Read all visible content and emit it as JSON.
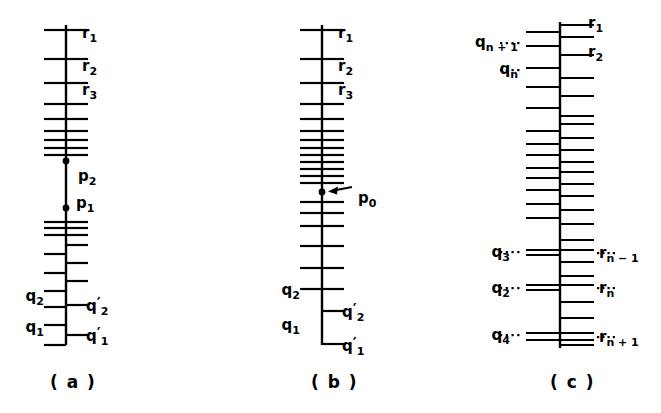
{
  "figure": {
    "background_color": "#ffffff",
    "ink_color": "#000000",
    "panels": [
      {
        "id": "panel-a",
        "caption": "( a )",
        "axis": {
          "x": 66,
          "top": 25,
          "bottom": 345
        },
        "right_labels": [
          {
            "text": "r",
            "sub": "1",
            "prime": false,
            "y": 33
          },
          {
            "text": "r",
            "sub": "2",
            "prime": false,
            "y": 66
          },
          {
            "text": "r",
            "sub": "3",
            "prime": false,
            "y": 90
          },
          {
            "text": "q",
            "sub": "2",
            "prime": true,
            "y": 305
          },
          {
            "text": "q",
            "sub": "1",
            "prime": true,
            "y": 335
          }
        ],
        "left_labels": [
          {
            "text": "q",
            "sub": "2",
            "prime": false,
            "y": 296
          },
          {
            "text": "q",
            "sub": "1",
            "prime": false,
            "y": 327
          }
        ],
        "points": [
          {
            "text": "p",
            "sub": "2",
            "y": 161,
            "label_dx": 12,
            "label_dy": 14
          },
          {
            "text": "p",
            "sub": "1",
            "y": 208,
            "label_dx": 12,
            "label_dy": -6
          }
        ],
        "left_ticks_y": [
          30,
          59,
          83,
          104,
          119,
          131,
          140,
          148,
          155,
          222,
          228,
          235,
          254,
          273,
          291,
          307,
          325,
          345
        ],
        "right_ticks_y": [
          30,
          59,
          83,
          104,
          119,
          131,
          140,
          148,
          155,
          222,
          228,
          235,
          245,
          263,
          281,
          305,
          335
        ]
      },
      {
        "id": "panel-b",
        "caption": "( b )",
        "axis": {
          "x": 322,
          "top": 25,
          "bottom": 345
        },
        "right_labels": [
          {
            "text": "r",
            "sub": "1",
            "prime": false,
            "y": 33
          },
          {
            "text": "r",
            "sub": "2",
            "prime": false,
            "y": 66
          },
          {
            "text": "r",
            "sub": "3",
            "prime": false,
            "y": 90
          },
          {
            "text": "q",
            "sub": "2",
            "prime": true,
            "y": 311
          },
          {
            "text": "q",
            "sub": "1",
            "prime": true,
            "y": 344
          }
        ],
        "left_labels": [
          {
            "text": "q",
            "sub": "2",
            "prime": false,
            "y": 290
          },
          {
            "text": "q",
            "sub": "1",
            "prime": false,
            "y": 325
          }
        ],
        "points": [
          {
            "text": "p",
            "sub": "0",
            "y": 192,
            "arrow": true,
            "label_dx": 38,
            "label_dy": 9
          }
        ],
        "left_ticks_y": [
          30,
          59,
          83,
          104,
          119,
          131,
          140,
          148,
          155,
          162,
          169,
          176,
          183,
          202,
          213,
          226,
          246,
          268,
          289
        ],
        "right_ticks_y": [
          30,
          59,
          83,
          104,
          119,
          131,
          140,
          148,
          155,
          162,
          169,
          176,
          183,
          202,
          213,
          226,
          246,
          268,
          289,
          311,
          344
        ]
      },
      {
        "id": "panel-c",
        "caption": "( c )",
        "axis": {
          "x": 560,
          "top": 22,
          "bottom": 348
        },
        "right_labels": [
          {
            "text": "r",
            "sub": "1",
            "prime": false,
            "y": 24,
            "dots": false
          },
          {
            "text": "r",
            "sub": "2",
            "prime": false,
            "y": 52,
            "dots": false
          },
          {
            "text": "r",
            "sub": "n − 1",
            "prime": false,
            "y": 253,
            "dots": true
          },
          {
            "text": "r",
            "sub": "n",
            "prime": false,
            "y": 288,
            "dots": true
          },
          {
            "text": "r",
            "sub": "n + 1",
            "prime": false,
            "y": 337,
            "dots": true
          }
        ],
        "left_labels": [
          {
            "text": "q",
            "sub": "n + 1",
            "prime": false,
            "y": 43,
            "dots": true
          },
          {
            "text": "q",
            "sub": "n",
            "prime": false,
            "y": 70,
            "dots": true
          },
          {
            "text": "q",
            "sub": "3",
            "prime": false,
            "y": 252,
            "dots": true
          },
          {
            "text": "q",
            "sub": "2",
            "prime": false,
            "y": 288,
            "dots": true
          },
          {
            "text": "q",
            "sub": "4",
            "prime": false,
            "y": 335,
            "dots": true
          }
        ],
        "points": [],
        "left_ticks_y": [
          32,
          46,
          68,
          87,
          108,
          131,
          144,
          155,
          168,
          178,
          190,
          204,
          218,
          250,
          255,
          285,
          290,
          333,
          340
        ],
        "right_ticks_y": [
          25,
          37,
          55,
          78,
          96,
          116,
          124,
          138,
          150,
          162,
          172,
          184,
          196,
          210,
          224,
          240,
          250,
          262,
          276,
          285,
          302,
          318,
          333,
          340,
          345
        ]
      }
    ]
  }
}
